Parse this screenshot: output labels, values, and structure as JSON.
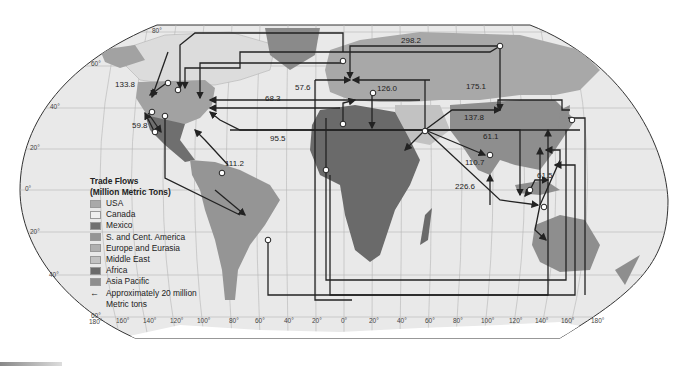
{
  "legend": {
    "title_line1": "Trade Flows",
    "title_line2": "(Million Metric Tons)",
    "items": [
      {
        "label": "USA",
        "color": "#a9a9a9"
      },
      {
        "label": "Canada",
        "color": "#e6e6e6"
      },
      {
        "label": "Mexico",
        "color": "#6f6f6f"
      },
      {
        "label": "S. and Cent. America",
        "color": "#959595"
      },
      {
        "label": "Europe and Eurasia",
        "color": "#b0b0b0"
      },
      {
        "label": "Middle East",
        "color": "#c2c2c2"
      },
      {
        "label": "Africa",
        "color": "#6a6a6a"
      },
      {
        "label": "Asia Pacific",
        "color": "#8e8e8e"
      }
    ],
    "arrow_label_line1": "Approximately 20 million",
    "arrow_label_line2": "Metric tons"
  },
  "flow_labels": [
    {
      "value": "133.8",
      "x": 115,
      "y": 87
    },
    {
      "value": "59.8",
      "x": 136,
      "y": 128
    },
    {
      "value": "111.2",
      "x": 225,
      "y": 165
    },
    {
      "value": "68.3",
      "x": 265,
      "y": 101
    },
    {
      "value": "57.6",
      "x": 295,
      "y": 90
    },
    {
      "value": "95.5",
      "x": 270,
      "y": 141
    },
    {
      "value": "126.0",
      "x": 377,
      "y": 91
    },
    {
      "value": "298.2",
      "x": 401,
      "y": 43
    },
    {
      "value": "175.1",
      "x": 466,
      "y": 89
    },
    {
      "value": "137.8",
      "x": 464,
      "y": 120
    },
    {
      "value": "61.1",
      "x": 485,
      "y": 139
    },
    {
      "value": "110.7",
      "x": 466,
      "y": 165
    },
    {
      "value": "226.6",
      "x": 455,
      "y": 189
    },
    {
      "value": "61.5",
      "x": 537,
      "y": 178
    }
  ],
  "graticule": {
    "lat_labels": [
      {
        "text": "80°",
        "x": 152,
        "y": 33
      },
      {
        "text": "60°",
        "x": 91,
        "y": 66
      },
      {
        "text": "40°",
        "x": 50,
        "y": 109
      },
      {
        "text": "20°",
        "x": 30,
        "y": 150
      },
      {
        "text": "0°",
        "x": 25,
        "y": 191
      },
      {
        "text": "20°",
        "x": 30,
        "y": 234
      },
      {
        "text": "40°",
        "x": 49,
        "y": 277
      },
      {
        "text": "60°",
        "x": 91,
        "y": 318
      }
    ],
    "lon_labels": [
      {
        "text": "180°",
        "x": 91,
        "y": 324
      },
      {
        "text": "160°",
        "x": 116,
        "y": 323
      },
      {
        "text": "140°",
        "x": 143,
        "y": 323
      },
      {
        "text": "120°",
        "x": 170,
        "y": 323
      },
      {
        "text": "100°",
        "x": 197,
        "y": 323
      },
      {
        "text": "80°",
        "x": 229,
        "y": 323
      },
      {
        "text": "60°",
        "x": 255,
        "y": 323
      },
      {
        "text": "40°",
        "x": 284,
        "y": 323
      },
      {
        "text": "20°",
        "x": 312,
        "y": 323
      },
      {
        "text": "0°",
        "x": 341,
        "y": 323
      },
      {
        "text": "20°",
        "x": 369,
        "y": 323
      },
      {
        "text": "40°",
        "x": 397,
        "y": 323
      },
      {
        "text": "60°",
        "x": 425,
        "y": 323
      },
      {
        "text": "80°",
        "x": 453,
        "y": 323
      },
      {
        "text": "100°",
        "x": 481,
        "y": 323
      },
      {
        "text": "120°",
        "x": 509,
        "y": 323
      },
      {
        "text": "140°",
        "x": 535,
        "y": 323
      },
      {
        "text": "160°",
        "x": 561,
        "y": 323
      },
      {
        "text": "180°",
        "x": 591,
        "y": 323
      }
    ]
  }
}
